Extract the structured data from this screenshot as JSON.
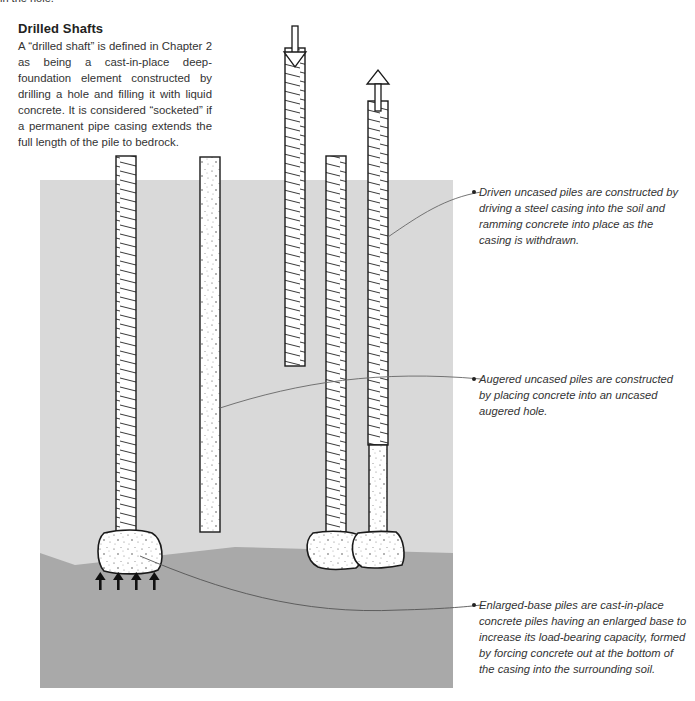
{
  "page": {
    "previous_text_fragment": "in the hole."
  },
  "sidebar": {
    "heading": "Drilled Shafts",
    "body": "A “drilled shaft” is defined in Chapter 2 as being a cast-in-place deep-foundation element constructed by drilling a hole and filling it with liquid concrete. It is considered “socketed” if a permanent pipe casing extends the full length of the pile to bedrock."
  },
  "diagram": {
    "colors": {
      "upper_soil": "#d9d9d9",
      "lower_soil": "#a9a9a9",
      "pile_fill": "#ffffff",
      "outline": "#1a1a1a",
      "leader_line": "#666666"
    },
    "icons": [
      "down-arrow-icon",
      "up-arrow-icon",
      "load-arrows-icon"
    ]
  },
  "callouts": [
    {
      "id": "driven-uncased",
      "text": "Driven uncased piles are constructed by driving a steel casing into the soil and ramming concrete into place as the casing is withdrawn."
    },
    {
      "id": "augered-uncased",
      "text": "Augered uncased piles are constructed by placing concrete into an uncased augered hole."
    },
    {
      "id": "enlarged-base",
      "text": "Enlarged-base piles are cast-in-place concrete piles having an enlarged base to increase its load-bearing capacity, formed by forcing concrete out at the bottom of the casing into the surrounding soil."
    }
  ]
}
